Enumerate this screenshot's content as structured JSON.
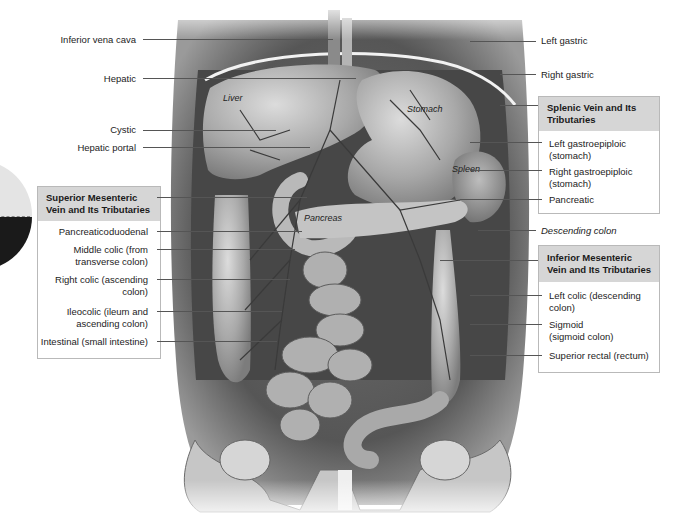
{
  "figure": {
    "organ_labels": {
      "liver": "Liver",
      "stomach": "Stomach",
      "spleen": "Spleen",
      "pancreas": "Pancreas"
    },
    "left_labels": [
      {
        "id": "inferior-vena-cava",
        "text": "Inferior vena cava"
      },
      {
        "id": "hepatic",
        "text": "Hepatic"
      },
      {
        "id": "cystic",
        "text": "Cystic"
      },
      {
        "id": "hepatic-portal",
        "text": "Hepatic portal"
      }
    ],
    "right_labels": [
      {
        "id": "left-gastric",
        "text": "Left gastric"
      },
      {
        "id": "right-gastric",
        "text": "Right gastric"
      },
      {
        "id": "descending-colon",
        "text": "Descending colon"
      }
    ],
    "boxes": {
      "superior_mesenteric": {
        "title_line1": "Superior Mesenteric",
        "title_line2": "Vein and Its Tributaries",
        "items": [
          {
            "line1": "Pancreaticoduodenal",
            "line2": ""
          },
          {
            "line1": "Middle colic (from",
            "line2": "transverse colon)"
          },
          {
            "line1": "Right colic (ascending",
            "line2": "colon)"
          },
          {
            "line1": "Ileocolic (ileum and",
            "line2": "ascending colon)"
          },
          {
            "line1": "Intestinal (small intestine)",
            "line2": ""
          }
        ]
      },
      "splenic": {
        "title_line1": "Splenic Vein and Its",
        "title_line2": "Tributaries",
        "items": [
          {
            "line1": "Left gastroepiploic",
            "line2": "(stomach)"
          },
          {
            "line1": "Right gastroepiploic",
            "line2": "(stomach)"
          },
          {
            "line1": "Pancreatic",
            "line2": ""
          }
        ]
      },
      "inferior_mesenteric": {
        "title_line1": "Inferior Mesenteric",
        "title_line2": "Vein and Its Tributaries",
        "items": [
          {
            "line1": "Left colic (descending",
            "line2": "colon)"
          },
          {
            "line1": "Sigmoid",
            "line2": "(sigmoid colon)"
          },
          {
            "line1": "Superior rectal (rectum)",
            "line2": ""
          }
        ]
      }
    },
    "colors": {
      "box_header": "#d6d6d6",
      "box_border": "#b9b9b9",
      "leader_line": "#555555"
    }
  }
}
